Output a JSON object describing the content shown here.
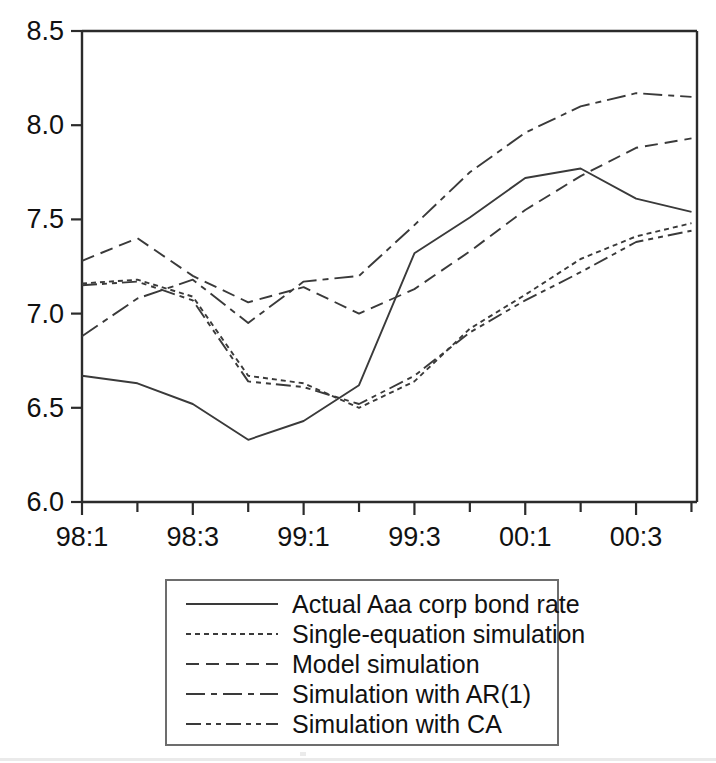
{
  "chart_data": {
    "type": "line",
    "title": "",
    "xlabel": "",
    "ylabel": "",
    "ylim": [
      6.0,
      8.5
    ],
    "yticks": [
      "6.0",
      "6.5",
      "7.0",
      "7.5",
      "8.0",
      "8.5"
    ],
    "ytick_values": [
      6.0,
      6.5,
      7.0,
      7.5,
      8.0,
      8.5
    ],
    "grid": false,
    "legend_position": "below-axes",
    "x": [
      "98:1",
      "98:2",
      "98:3",
      "98:4",
      "99:1",
      "99:2",
      "99:3",
      "99:4",
      "00:1",
      "00:2",
      "00:3",
      "00:4"
    ],
    "xtick_labels": [
      "98:1",
      "98:3",
      "99:1",
      "99:3",
      "00:1",
      "00:3"
    ],
    "xtick_label_indices": [
      0,
      2,
      4,
      6,
      8,
      10
    ],
    "minor_ticks": true,
    "series": [
      {
        "name": "Actual Aaa corp bond rate",
        "style": "solid",
        "values": [
          6.67,
          6.63,
          6.52,
          6.33,
          6.43,
          6.62,
          7.32,
          7.51,
          7.72,
          7.77,
          7.61,
          7.54
        ]
      },
      {
        "name": "Single-equation simulation",
        "style": "short-dash",
        "values": [
          7.16,
          7.18,
          7.09,
          6.67,
          6.63,
          6.5,
          6.64,
          6.92,
          7.1,
          7.29,
          7.41,
          7.48
        ]
      },
      {
        "name": "Model simulation",
        "style": "dash",
        "values": [
          7.28,
          7.4,
          7.2,
          7.06,
          7.14,
          7.0,
          7.13,
          7.33,
          7.55,
          7.73,
          7.88,
          7.93
        ]
      },
      {
        "name": "Simulation with AR(1)",
        "style": "dash-dot",
        "values": [
          6.88,
          7.08,
          7.18,
          6.95,
          7.17,
          7.2,
          7.47,
          7.75,
          7.96,
          8.1,
          8.17,
          8.15
        ]
      },
      {
        "name": "Simulation with CA",
        "style": "dash-dot-dot",
        "values": [
          7.15,
          7.17,
          7.07,
          6.64,
          6.61,
          6.52,
          6.67,
          6.9,
          7.07,
          7.22,
          7.38,
          7.44
        ]
      }
    ]
  },
  "legend": {
    "entries": [
      {
        "label": "Actual Aaa corp bond rate",
        "style": "solid"
      },
      {
        "label": "Single-equation simulation",
        "style": "short-dash"
      },
      {
        "label": "Model simulation",
        "style": "dash"
      },
      {
        "label": "Simulation with AR(1)",
        "style": "dash-dot"
      },
      {
        "label": "Simulation with CA",
        "style": "dash-dot-dot"
      }
    ]
  },
  "colors": {
    "line": "#3a3a3a",
    "axis": "#2b2b2b",
    "text": "#111111",
    "background": "#ffffff",
    "legend_border": "#6d6d6d"
  }
}
